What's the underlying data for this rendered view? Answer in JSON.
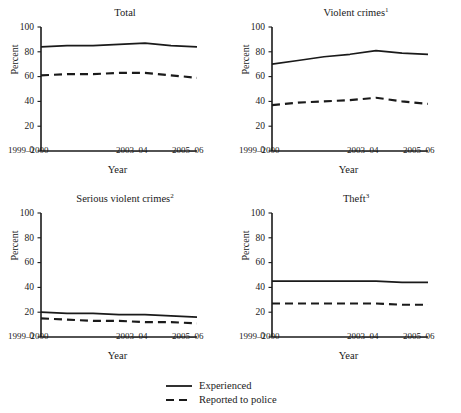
{
  "figure": {
    "cut_off_header": "",
    "axis_label_x": "Year",
    "axis_label_y": "Percent"
  },
  "legend": {
    "items": [
      {
        "label": "Experienced",
        "style": "solid",
        "swatch_name": "legend-line-solid"
      },
      {
        "label": "Reported to police",
        "style": "dashed",
        "swatch_name": "legend-line-dashed"
      }
    ]
  },
  "chart_data": [
    {
      "type": "line",
      "title": "Total",
      "title_superscript": "",
      "xlabel": "Year",
      "ylabel": "Percent",
      "ylim": [
        0,
        100
      ],
      "yticks": [
        0,
        20,
        40,
        60,
        80,
        100
      ],
      "x": [
        "1999–2000",
        "2000–01",
        "2001–02",
        "2002–03",
        "2003–04",
        "2004–05",
        "2005–06"
      ],
      "xtick_labels": [
        "1999–2000",
        "2003–04",
        "2005–06"
      ],
      "grid": false,
      "legend_position": "below-figure",
      "series": [
        {
          "name": "Experienced",
          "style": "solid",
          "values": [
            84,
            85,
            85,
            86,
            87,
            85,
            84
          ]
        },
        {
          "name": "Reported to police",
          "style": "dashed",
          "values": [
            61,
            62,
            62,
            63,
            63,
            61,
            59
          ]
        }
      ]
    },
    {
      "type": "line",
      "title": "Violent crimes",
      "title_superscript": "1",
      "xlabel": "Year",
      "ylabel": "Percent",
      "ylim": [
        0,
        100
      ],
      "yticks": [
        0,
        20,
        40,
        60,
        80,
        100
      ],
      "x": [
        "1999–2000",
        "2000–01",
        "2001–02",
        "2002–03",
        "2003–04",
        "2004–05",
        "2005–06"
      ],
      "xtick_labels": [
        "1999–2000",
        "2003–04",
        "2005–06"
      ],
      "grid": false,
      "legend_position": "below-figure",
      "series": [
        {
          "name": "Experienced",
          "style": "solid",
          "values": [
            70,
            73,
            76,
            78,
            81,
            79,
            78
          ]
        },
        {
          "name": "Reported to police",
          "style": "dashed",
          "values": [
            37,
            39,
            40,
            41,
            43,
            40,
            38
          ]
        }
      ]
    },
    {
      "type": "line",
      "title": "Serious violent crimes",
      "title_superscript": "2",
      "xlabel": "Year",
      "ylabel": "Percent",
      "ylim": [
        0,
        100
      ],
      "yticks": [
        0,
        20,
        40,
        60,
        80,
        100
      ],
      "x": [
        "1999–2000",
        "2000–01",
        "2001–02",
        "2002–03",
        "2003–04",
        "2004–05",
        "2005–06"
      ],
      "xtick_labels": [
        "1999–2000",
        "2003–04",
        "2005–06"
      ],
      "grid": false,
      "legend_position": "below-figure",
      "series": [
        {
          "name": "Experienced",
          "style": "solid",
          "values": [
            20,
            19,
            19,
            18,
            18,
            17,
            16
          ]
        },
        {
          "name": "Reported to police",
          "style": "dashed",
          "values": [
            15,
            14,
            13,
            13,
            12,
            12,
            11
          ]
        }
      ]
    },
    {
      "type": "line",
      "title": "Theft",
      "title_superscript": "3",
      "xlabel": "Year",
      "ylabel": "Percent",
      "ylim": [
        0,
        100
      ],
      "yticks": [
        0,
        20,
        40,
        60,
        80,
        100
      ],
      "x": [
        "1999–2000",
        "2000–01",
        "2001–02",
        "2002–03",
        "2003–04",
        "2004–05",
        "2005–06"
      ],
      "xtick_labels": [
        "1999–2000",
        "2003–04",
        "2005–06"
      ],
      "grid": false,
      "legend_position": "below-figure",
      "series": [
        {
          "name": "Experienced",
          "style": "solid",
          "values": [
            45,
            45,
            45,
            45,
            45,
            44,
            44
          ]
        },
        {
          "name": "Reported to police",
          "style": "dashed",
          "values": [
            27,
            27,
            27,
            27,
            27,
            26,
            26
          ]
        }
      ]
    }
  ],
  "colors": {
    "line": "#1a1a1a",
    "axis": "#1a1a1a",
    "text": "#1a1a1a",
    "background": "#ffffff"
  }
}
